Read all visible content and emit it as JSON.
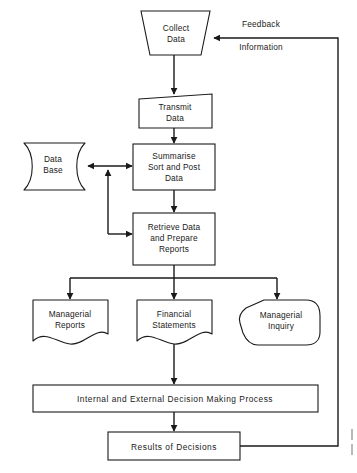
{
  "diagram": {
    "background_color": "#ffffff",
    "line_color": "#1a1a1a",
    "nodes": {
      "collect": {
        "id": "collect-data",
        "shape": "trapezoid",
        "lines": [
          "Collect",
          "Data"
        ]
      },
      "transmit": {
        "id": "transmit-data",
        "shape": "quadrilateral",
        "lines": [
          "Transmit",
          "Data"
        ]
      },
      "summarise": {
        "id": "summarise-sort-post",
        "shape": "rectangle",
        "lines": [
          "Summarise",
          "Sort and Post",
          "Data"
        ]
      },
      "database": {
        "id": "data-base",
        "shape": "cylinder",
        "lines": [
          "Data",
          "Base"
        ]
      },
      "retrieve": {
        "id": "retrieve-prepare",
        "shape": "rectangle",
        "lines": [
          "Retrieve Data",
          "and Prepare",
          "Reports"
        ]
      },
      "managerial_reports": {
        "id": "managerial-reports",
        "shape": "document",
        "lines": [
          "Managerial",
          "Reports"
        ]
      },
      "financial_statements": {
        "id": "financial-statements",
        "shape": "document",
        "lines": [
          "Financial",
          "Statements"
        ]
      },
      "managerial_inquiry": {
        "id": "managerial-inquiry",
        "shape": "hexagon",
        "lines": [
          "Managerial",
          "Inquiry"
        ]
      },
      "decision_process": {
        "id": "decision-making-process",
        "shape": "rectangle",
        "lines": [
          "Internal and External Decision Making Process"
        ]
      },
      "results": {
        "id": "results-of-decisions",
        "shape": "rectangle",
        "lines": [
          "Results of Decisions"
        ]
      }
    },
    "edge_labels": {
      "feedback_line1": "Feedback",
      "feedback_line2": "Information"
    }
  }
}
